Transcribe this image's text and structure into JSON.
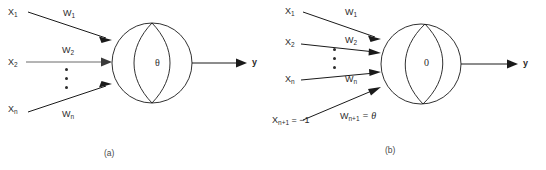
{
  "figure": {
    "panels": [
      {
        "id": "a",
        "caption": "(a)",
        "node_symbol": "θ",
        "node_symbol_name": "theta",
        "output_label": "y",
        "inputs": [
          {
            "input_label": "X",
            "input_sub": "1",
            "weight_label": "W",
            "weight_sub": "1"
          },
          {
            "input_label": "X",
            "input_sub": "2",
            "weight_label": "W",
            "weight_sub": "2"
          },
          {
            "input_label": "X",
            "input_sub": "n",
            "weight_label": "W",
            "weight_sub": "n"
          }
        ],
        "vertical_ellipsis": "⋮"
      },
      {
        "id": "b",
        "caption": "(b)",
        "node_symbol": "0",
        "node_symbol_name": "zero",
        "output_label": "y",
        "inputs": [
          {
            "input_label": "X",
            "input_sub": "1",
            "weight_label": "W",
            "weight_sub": "1"
          },
          {
            "input_label": "X",
            "input_sub": "2",
            "weight_label": "W",
            "weight_sub": "2"
          },
          {
            "input_label": "X",
            "input_sub": "n",
            "weight_label": "W",
            "weight_sub": "n"
          },
          {
            "input_label": "X",
            "input_sub": "n+1",
            "input_value": "= −1",
            "weight_label": "W",
            "weight_sub": "n+1",
            "weight_value": "= θ"
          }
        ],
        "vertical_ellipsis": "⋮"
      }
    ],
    "colors": {
      "ink": "#1a1a1a",
      "text": "#2b2b2b",
      "soft_line": "#6b6b6b",
      "caption": "#4a4a4a",
      "background": "#ffffff"
    }
  }
}
